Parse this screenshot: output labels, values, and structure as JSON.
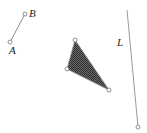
{
  "diagram": {
    "colors": {
      "stroke": "#8a8a8a",
      "fill": "#3c3c3c",
      "point_fill": "#ffffff",
      "label": "#222222"
    },
    "segment_ab": {
      "points": [
        {
          "label": "A",
          "x": 10,
          "y": 42,
          "label_x": 9,
          "label_y": 54
        },
        {
          "label": "B",
          "x": 25,
          "y": 14,
          "label_x": 29,
          "label_y": 17
        }
      ]
    },
    "triangle": {
      "vertices": [
        {
          "x": 75,
          "y": 40
        },
        {
          "x": 67,
          "y": 69
        },
        {
          "x": 109,
          "y": 90
        }
      ]
    },
    "line_l": {
      "label": "L",
      "start": {
        "x": 127,
        "y": 10
      },
      "end": {
        "x": 138,
        "y": 127
      },
      "label_x": 117,
      "label_y": 46
    }
  }
}
